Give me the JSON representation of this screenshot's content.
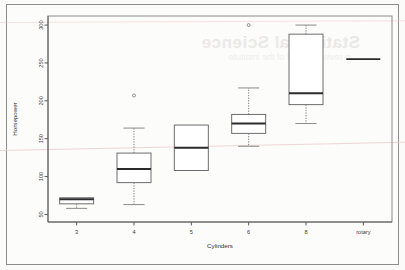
{
  "page": {
    "background_color": "#fbfbf9",
    "border_color": "#8d8d8d",
    "artifact_note": "scanned page with faint mirrored bleed-through text and pink scanner streak",
    "watermark_text": "Statistical Science",
    "watermark_subtext": "a review journal of the institute"
  },
  "chart_data": {
    "type": "box",
    "title": "",
    "xlabel": "Cylinders",
    "ylabel": "Horsepower",
    "categories": [
      "3",
      "4",
      "5",
      "6",
      "8",
      "rotary"
    ],
    "ylim": [
      40,
      312
    ],
    "yticks": [
      50,
      100,
      150,
      200,
      250,
      300
    ],
    "ytick_labels": [
      "50",
      "100",
      "150",
      "200",
      "250",
      "300"
    ],
    "grid": false,
    "legend": null,
    "box_color": "#ffffff",
    "line_color": "#6d6d6d",
    "median_color": "#2b2b2b",
    "boxes": [
      {
        "category": "3",
        "whisker_low": 58,
        "q1": 64,
        "median": 70,
        "q3": 72,
        "whisker_high": 72,
        "outliers": []
      },
      {
        "category": "4",
        "whisker_low": 63,
        "q1": 92,
        "median": 110,
        "q3": 131,
        "whisker_high": 164,
        "outliers": [
          207
        ]
      },
      {
        "category": "5",
        "whisker_low": 108,
        "q1": 108,
        "median": 138,
        "q3": 168,
        "whisker_high": 168,
        "outliers": []
      },
      {
        "category": "6",
        "whisker_low": 140,
        "q1": 157,
        "median": 170,
        "q3": 182,
        "whisker_high": 217,
        "outliers": [
          300
        ]
      },
      {
        "category": "8",
        "whisker_low": 170,
        "q1": 195,
        "median": 210,
        "q3": 288,
        "whisker_high": 300,
        "outliers": []
      },
      {
        "category": "rotary",
        "whisker_low": 255,
        "q1": 255,
        "median": 255,
        "q3": 255,
        "whisker_high": 255,
        "outliers": []
      }
    ]
  }
}
